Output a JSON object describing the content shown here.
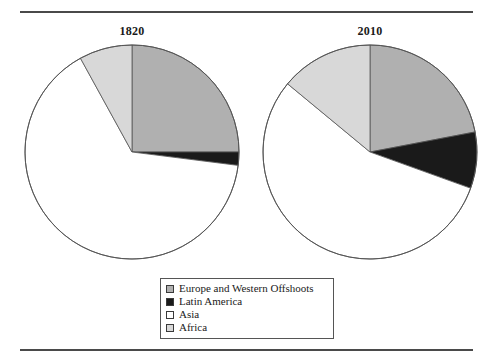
{
  "figure": {
    "rule_top_label": "top-divider-rule",
    "rule_bottom_label": "bottom-divider-rule"
  },
  "legend": {
    "entries": [
      {
        "label": "Europe and Western Offshoots",
        "color": "#b0b0b0",
        "swatch_name": "legend-swatch-europe"
      },
      {
        "label": "Latin America",
        "color": "#1a1a1a",
        "swatch_name": "legend-swatch-latin-america"
      },
      {
        "label": "Asia",
        "color": "#ffffff",
        "swatch_name": "legend-swatch-asia"
      },
      {
        "label": "Africa",
        "color": "#d8d8d8",
        "swatch_name": "legend-swatch-africa"
      }
    ]
  },
  "chart_data": {
    "type": "pie",
    "title": "",
    "xlabel": "",
    "ylabel": "",
    "legend_position": "bottom-center",
    "categories": [
      "Europe and Western Offshoots",
      "Latin America",
      "Asia",
      "Africa"
    ],
    "colors": [
      "#b0b0b0",
      "#1a1a1a",
      "#ffffff",
      "#d8d8d8"
    ],
    "charts": [
      {
        "title": "1820",
        "values": [
          25.0,
          2.0,
          65.0,
          8.0
        ],
        "units": "percent of world GDP share",
        "start_angle_deg": 0,
        "direction": "clockwise"
      },
      {
        "title": "2010",
        "values": [
          22.0,
          8.5,
          55.5,
          14.0
        ],
        "units": "percent of world GDP share",
        "start_angle_deg": 0,
        "direction": "clockwise"
      }
    ]
  }
}
